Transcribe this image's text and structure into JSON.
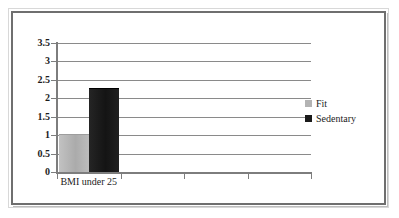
{
  "chart_data": {
    "type": "bar",
    "title": "",
    "subtitle": "",
    "xlabel": "",
    "ylabel": "",
    "categories": [
      "BMI under 25",
      "",
      "",
      ""
    ],
    "series": [
      {
        "name": "Fit",
        "color": "#b3b3b3",
        "values": [
          1,
          null,
          null,
          null
        ]
      },
      {
        "name": "Sedentary",
        "color": "#1a1a1a",
        "values": [
          2.25,
          null,
          null,
          null
        ]
      }
    ],
    "ylim": [
      0,
      3.5
    ],
    "ytick_values": [
      0,
      0.5,
      1,
      1.5,
      2,
      2.5,
      3,
      3.5
    ],
    "ytick_labels": [
      "0",
      "0.5",
      "1",
      "1.5",
      "2",
      "2.5",
      "3",
      "3.5"
    ],
    "grid": "horizontal",
    "legend_position": "right",
    "annotations": []
  },
  "axis": {
    "y_labels": [
      "3.5",
      "3",
      "2.5",
      "2",
      "1.5",
      "1",
      "0.5",
      "0"
    ],
    "x_categories": [
      "BMI under 25"
    ]
  },
  "legend": {
    "entries": [
      {
        "label": "Fit",
        "swatch": "#b3b3b3"
      },
      {
        "label": "Sedentary",
        "swatch": "#1a1a1a"
      }
    ]
  },
  "colors": {
    "fit": "#b3b3b3",
    "sedentary": "#1a1a1a",
    "grid": "#8a8a8a",
    "axis": "#7d7d7d",
    "frame": "#6f6f6f",
    "background": "#ffffff",
    "text": "#1c1c1c"
  }
}
